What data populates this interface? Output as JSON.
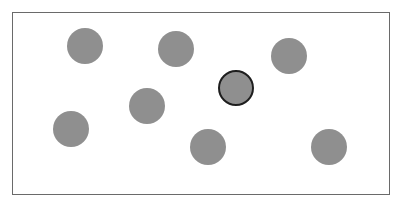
{
  "canvas": {
    "frame": {
      "left": 12,
      "top": 12,
      "right": 390,
      "bottom": 195
    },
    "dot_color": "#8f8f8f",
    "selected_border_color": "#1e1e1e",
    "dots": [
      {
        "cx": 85,
        "cy": 46,
        "r": 18,
        "selected": false
      },
      {
        "cx": 176,
        "cy": 49,
        "r": 18,
        "selected": false
      },
      {
        "cx": 289,
        "cy": 56,
        "r": 18,
        "selected": false
      },
      {
        "cx": 236,
        "cy": 88,
        "r": 18,
        "selected": true
      },
      {
        "cx": 147,
        "cy": 106,
        "r": 18,
        "selected": false
      },
      {
        "cx": 71,
        "cy": 129,
        "r": 18,
        "selected": false
      },
      {
        "cx": 208,
        "cy": 147,
        "r": 18,
        "selected": false
      },
      {
        "cx": 329,
        "cy": 147,
        "r": 18,
        "selected": false
      }
    ]
  }
}
